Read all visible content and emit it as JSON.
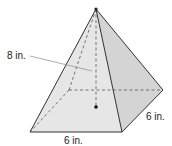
{
  "figure": {
    "type": "square pyramid",
    "labels": {
      "height": "8 in.",
      "base_front": "6 in.",
      "base_side": "6 in."
    },
    "colors": {
      "front_face": "#e6e6e6",
      "side_face": "#d4d4d4",
      "edge": "#333333",
      "hidden_edge": "#555555",
      "leader": "#888888"
    }
  }
}
